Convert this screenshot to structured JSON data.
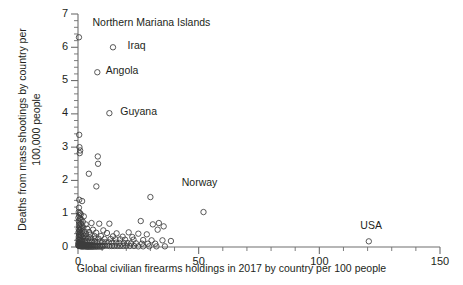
{
  "chart_data": {
    "type": "scatter",
    "title": "",
    "xlabel": "Global civilian firearms holdings in 2017 by country per 100 people",
    "ylabel": "Deaths from mass shootings by country per\n100,000 people",
    "xlim": [
      0,
      150
    ],
    "ylim": [
      0,
      7
    ],
    "xticks": [
      0,
      50,
      100,
      150
    ],
    "xtick_labels": [
      "0",
      "50",
      "100",
      "150"
    ],
    "xminor_step": 10,
    "yticks": [
      0,
      1,
      2,
      3,
      4,
      5,
      6,
      7
    ],
    "ytick_labels": [
      "0",
      "1",
      "2",
      "3",
      "4",
      "5",
      "6",
      "7"
    ],
    "yminor_step": 0.2,
    "grid": false,
    "legend": null,
    "marker": {
      "shape": "open-circle",
      "size": 5.4,
      "edge_color": "#3c3c3c",
      "face_color": "none"
    },
    "annotations": [
      {
        "label": "Northern Mariana Islands",
        "x": 0.4,
        "y": 6.3,
        "label_x": 6.0,
        "label_y": 6.72
      },
      {
        "label": "Iraq",
        "x": 14.5,
        "y": 6.0,
        "label_x": 20.5,
        "label_y": 6.05
      },
      {
        "label": "Angola",
        "x": 8.0,
        "y": 5.25,
        "label_x": 11.5,
        "label_y": 5.28
      },
      {
        "label": "Guyana",
        "x": 13.0,
        "y": 4.02,
        "label_x": 17.5,
        "label_y": 4.05
      },
      {
        "label": "Norway",
        "x": 30.0,
        "y": 1.5,
        "label_x": 43.0,
        "label_y": 1.92
      },
      {
        "label": "USA",
        "x": 120.5,
        "y": 0.17,
        "label_x": 117.0,
        "label_y": 0.62
      }
    ],
    "points": [
      [
        0.4,
        6.3
      ],
      [
        14.5,
        6.0
      ],
      [
        8.0,
        5.25
      ],
      [
        13.0,
        4.02
      ],
      [
        0.5,
        3.37
      ],
      [
        0.6,
        3.0
      ],
      [
        0.9,
        2.9
      ],
      [
        0.7,
        2.82
      ],
      [
        8.2,
        2.72
      ],
      [
        8.3,
        2.5
      ],
      [
        4.5,
        2.2
      ],
      [
        7.6,
        1.82
      ],
      [
        30.0,
        1.5
      ],
      [
        52.0,
        1.05
      ],
      [
        0.5,
        1.42
      ],
      [
        1.7,
        1.38
      ],
      [
        0.4,
        1.18
      ],
      [
        0.3,
        1.05
      ],
      [
        0.8,
        1.02
      ],
      [
        1.2,
        0.98
      ],
      [
        0.5,
        0.95
      ],
      [
        2.4,
        0.92
      ],
      [
        0.2,
        0.88
      ],
      [
        0.9,
        0.85
      ],
      [
        1.4,
        0.82
      ],
      [
        0.3,
        0.78
      ],
      [
        2.0,
        0.76
      ],
      [
        0.6,
        0.73
      ],
      [
        1.1,
        0.7
      ],
      [
        3.2,
        0.68
      ],
      [
        0.4,
        0.66
      ],
      [
        1.8,
        0.64
      ],
      [
        5.6,
        0.72
      ],
      [
        8.8,
        0.7
      ],
      [
        13.0,
        0.7
      ],
      [
        26.0,
        0.78
      ],
      [
        31.0,
        0.68
      ],
      [
        33.5,
        0.72
      ],
      [
        35.5,
        0.62
      ],
      [
        33.0,
        0.52
      ],
      [
        0.7,
        0.6
      ],
      [
        2.2,
        0.58
      ],
      [
        1.3,
        0.56
      ],
      [
        3.8,
        0.55
      ],
      [
        0.3,
        0.54
      ],
      [
        0.9,
        0.52
      ],
      [
        6.2,
        0.52
      ],
      [
        10.5,
        0.5
      ],
      [
        0.5,
        0.48
      ],
      [
        1.6,
        0.47
      ],
      [
        2.8,
        0.46
      ],
      [
        4.6,
        0.45
      ],
      [
        0.2,
        0.44
      ],
      [
        1.0,
        0.43
      ],
      [
        7.5,
        0.43
      ],
      [
        12.0,
        0.42
      ],
      [
        16.0,
        0.41
      ],
      [
        21.0,
        0.44
      ],
      [
        25.0,
        0.4
      ],
      [
        28.5,
        0.38
      ],
      [
        0.6,
        0.4
      ],
      [
        1.9,
        0.39
      ],
      [
        3.4,
        0.38
      ],
      [
        5.0,
        0.37
      ],
      [
        0.4,
        0.36
      ],
      [
        1.2,
        0.35
      ],
      [
        2.5,
        0.34
      ],
      [
        6.8,
        0.33
      ],
      [
        9.5,
        0.33
      ],
      [
        14.5,
        0.32
      ],
      [
        18.5,
        0.31
      ],
      [
        22.5,
        0.3
      ],
      [
        0.3,
        0.3
      ],
      [
        0.8,
        0.29
      ],
      [
        1.5,
        0.28
      ],
      [
        2.1,
        0.28
      ],
      [
        3.0,
        0.27
      ],
      [
        4.2,
        0.26
      ],
      [
        5.5,
        0.26
      ],
      [
        7.0,
        0.25
      ],
      [
        8.5,
        0.25
      ],
      [
        11.0,
        0.24
      ],
      [
        13.5,
        0.24
      ],
      [
        15.5,
        0.23
      ],
      [
        17.5,
        0.23
      ],
      [
        19.5,
        0.22
      ],
      [
        23.0,
        0.22
      ],
      [
        27.0,
        0.21
      ],
      [
        30.5,
        0.2
      ],
      [
        35.0,
        0.2
      ],
      [
        38.5,
        0.18
      ],
      [
        0.2,
        0.22
      ],
      [
        0.5,
        0.21
      ],
      [
        0.9,
        0.2
      ],
      [
        1.3,
        0.2
      ],
      [
        1.7,
        0.19
      ],
      [
        2.3,
        0.19
      ],
      [
        2.9,
        0.18
      ],
      [
        3.6,
        0.18
      ],
      [
        4.4,
        0.17
      ],
      [
        5.2,
        0.17
      ],
      [
        6.0,
        0.16
      ],
      [
        6.9,
        0.16
      ],
      [
        7.8,
        0.15
      ],
      [
        9.0,
        0.15
      ],
      [
        10.2,
        0.15
      ],
      [
        11.5,
        0.14
      ],
      [
        12.8,
        0.14
      ],
      [
        14.2,
        0.13
      ],
      [
        15.8,
        0.13
      ],
      [
        17.2,
        0.12
      ],
      [
        19.0,
        0.12
      ],
      [
        20.5,
        0.12
      ],
      [
        22.0,
        0.11
      ],
      [
        24.0,
        0.11
      ],
      [
        26.5,
        0.1
      ],
      [
        29.0,
        0.1
      ],
      [
        32.0,
        0.1
      ],
      [
        120.5,
        0.17
      ],
      [
        0.15,
        0.12
      ],
      [
        0.35,
        0.11
      ],
      [
        0.55,
        0.11
      ],
      [
        0.75,
        0.1
      ],
      [
        0.95,
        0.1
      ],
      [
        1.15,
        0.09
      ],
      [
        1.35,
        0.09
      ],
      [
        1.55,
        0.08
      ],
      [
        1.75,
        0.08
      ],
      [
        2.0,
        0.08
      ],
      [
        2.25,
        0.07
      ],
      [
        2.5,
        0.07
      ],
      [
        2.75,
        0.07
      ],
      [
        3.1,
        0.06
      ],
      [
        3.4,
        0.06
      ],
      [
        3.7,
        0.06
      ],
      [
        4.0,
        0.06
      ],
      [
        4.3,
        0.05
      ],
      [
        4.7,
        0.05
      ],
      [
        5.1,
        0.05
      ],
      [
        5.5,
        0.05
      ],
      [
        6.0,
        0.05
      ],
      [
        6.5,
        0.05
      ],
      [
        7.0,
        0.04
      ],
      [
        7.6,
        0.04
      ],
      [
        8.2,
        0.04
      ],
      [
        8.9,
        0.04
      ],
      [
        9.6,
        0.04
      ],
      [
        10.4,
        0.04
      ],
      [
        11.2,
        0.04
      ],
      [
        12.1,
        0.04
      ],
      [
        13.0,
        0.03
      ],
      [
        14.0,
        0.03
      ],
      [
        15.0,
        0.03
      ],
      [
        16.2,
        0.03
      ],
      [
        17.4,
        0.03
      ],
      [
        18.7,
        0.03
      ],
      [
        20.0,
        0.03
      ],
      [
        21.5,
        0.03
      ],
      [
        23.2,
        0.03
      ],
      [
        25.0,
        0.02
      ],
      [
        27.0,
        0.02
      ],
      [
        29.5,
        0.02
      ],
      [
        32.5,
        0.02
      ],
      [
        36.0,
        0.02
      ],
      [
        0.1,
        0.05
      ],
      [
        0.25,
        0.04
      ],
      [
        0.4,
        0.04
      ],
      [
        0.6,
        0.03
      ],
      [
        0.8,
        0.03
      ],
      [
        1.0,
        0.03
      ],
      [
        1.25,
        0.02
      ],
      [
        1.5,
        0.02
      ],
      [
        1.8,
        0.02
      ],
      [
        2.1,
        0.02
      ],
      [
        2.4,
        0.02
      ],
      [
        2.8,
        0.02
      ],
      [
        3.2,
        0.02
      ],
      [
        3.6,
        0.01
      ],
      [
        4.1,
        0.01
      ],
      [
        4.6,
        0.01
      ],
      [
        5.2,
        0.01
      ],
      [
        5.8,
        0.01
      ],
      [
        6.4,
        0.01
      ],
      [
        7.2,
        0.01
      ],
      [
        8.0,
        0.01
      ],
      [
        9.0,
        0.01
      ],
      [
        10.0,
        0.01
      ]
    ]
  },
  "axes": {
    "axis_color": "#6e6e6e",
    "text_color": "#231f20"
  }
}
